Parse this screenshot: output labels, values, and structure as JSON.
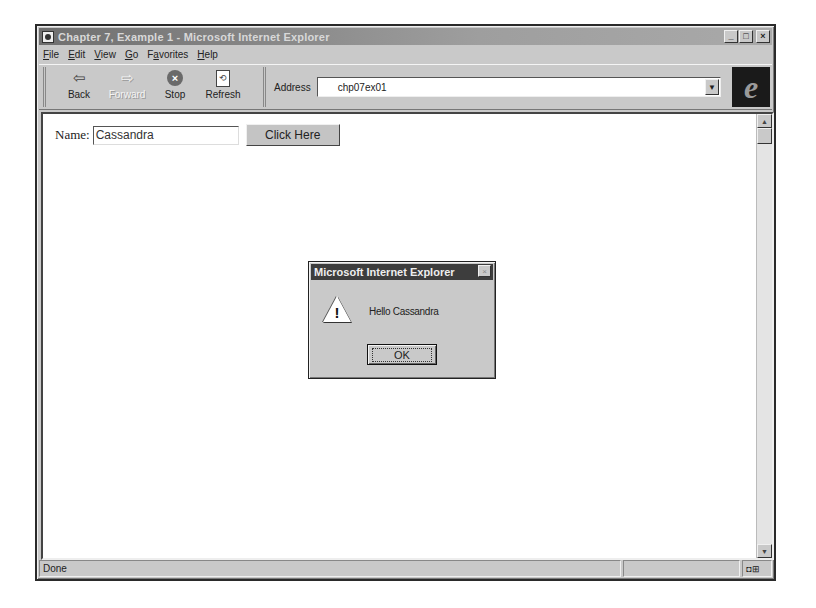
{
  "window": {
    "title": "Chapter 7, Example 1 - Microsoft Internet Explorer",
    "controls": {
      "minimize": "_",
      "maximize": "□",
      "close": "×"
    }
  },
  "menubar": {
    "items": [
      {
        "accel": "F",
        "rest": "ile"
      },
      {
        "accel": "E",
        "rest": "dit"
      },
      {
        "accel": "V",
        "rest": "iew"
      },
      {
        "accel": "G",
        "rest": "o"
      },
      {
        "pre": "F",
        "accel": "a",
        "rest": "vorites"
      },
      {
        "accel": "H",
        "rest": "elp"
      }
    ]
  },
  "toolbar": {
    "back": {
      "label": "Back",
      "icon": "⇦"
    },
    "forward": {
      "label": "Forward",
      "icon": "⇨"
    },
    "stop": {
      "label": "Stop",
      "icon": "×"
    },
    "refresh": {
      "label": "Refresh",
      "icon": "⟲"
    }
  },
  "address": {
    "label": "Address",
    "value": "chp07ex01",
    "dropdown_icon": "▼"
  },
  "brand": {
    "logo": "e"
  },
  "page": {
    "name_label": "Name:",
    "name_value": "Cassandra",
    "button_label": "Click Here"
  },
  "scrollbar": {
    "up": "▲",
    "down": "▼"
  },
  "status": {
    "text": "Done",
    "zone_icons": "◘⊞"
  },
  "dialog": {
    "title": "Microsoft Internet Explorer",
    "close_icon": "×",
    "warning_mark": "!",
    "message": "Hello Cassandra",
    "ok_label": "OK"
  }
}
